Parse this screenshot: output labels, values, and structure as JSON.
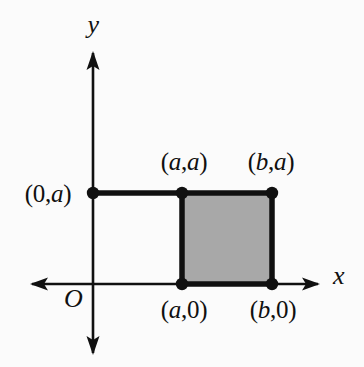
{
  "figure": {
    "type": "coordinate-diagram",
    "background_color": "#fbfbfb",
    "stroke_color": "#101010",
    "shade_color": "#a8a8a8",
    "axes": {
      "x_label": "x",
      "y_label": "y",
      "origin_label": "O",
      "x_axis": {
        "y_px": 284,
        "x_start_px": 32,
        "x_end_px": 318,
        "arrows": "both"
      },
      "y_axis": {
        "x_px": 93,
        "y_start_px": 53,
        "y_end_px": 353,
        "arrows": "both"
      }
    },
    "points": [
      {
        "name": "point-0-a",
        "label": "(0,a)",
        "label_open": "(",
        "label_part1": "0",
        "label_comma": ",",
        "label_part2": "a",
        "label_close": ")",
        "x_px": 93,
        "y_px": 193,
        "label_x_px": 48,
        "label_y_px": 181,
        "label_anchor": "center"
      },
      {
        "name": "point-a-a",
        "label": "(a,a)",
        "label_open": "(",
        "label_part1": "a",
        "label_comma": ",",
        "label_part2": "a",
        "label_close": ")",
        "x_px": 182,
        "y_px": 193,
        "label_x_px": 184,
        "label_y_px": 149,
        "label_anchor": "center"
      },
      {
        "name": "point-b-a",
        "label": "(b,a)",
        "label_open": "(",
        "label_part1": "b",
        "label_comma": ",",
        "label_part2": "a",
        "label_close": ")",
        "x_px": 272,
        "y_px": 193,
        "label_x_px": 271,
        "label_y_px": 149,
        "label_anchor": "center"
      },
      {
        "name": "point-a-0",
        "label": "(a,0)",
        "label_open": "(",
        "label_part1": "a",
        "label_comma": ",",
        "label_part2": "0",
        "label_close": ")",
        "x_px": 182,
        "y_px": 284,
        "label_x_px": 184,
        "label_y_px": 297,
        "label_anchor": "center"
      },
      {
        "name": "point-b-0",
        "label": "(b,0)",
        "label_open": "(",
        "label_part1": "b",
        "label_comma": ",",
        "label_part2": "0",
        "label_close": ")",
        "x_px": 272,
        "y_px": 284,
        "label_x_px": 273,
        "label_y_px": 297,
        "label_anchor": "center"
      }
    ],
    "shaded_rectangle": {
      "name": "shaded-rectangle",
      "left_px": 182,
      "right_px": 272,
      "top_px": 193,
      "bottom_px": 284,
      "vertices": [
        "(a,0)",
        "(b,0)",
        "(b,a)",
        "(a,a)"
      ],
      "fill": "#a8a8a8"
    },
    "segments": [
      {
        "name": "segment-0a-to-aa",
        "x1_px": 93,
        "y1_px": 193,
        "x2_px": 182,
        "y2_px": 193
      }
    ]
  }
}
